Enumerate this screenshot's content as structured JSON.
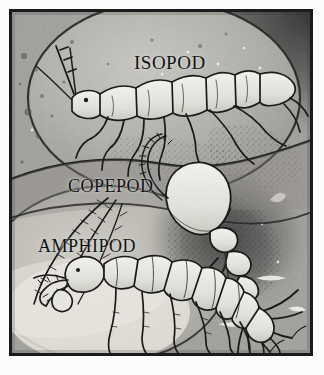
{
  "plate": {
    "title": "Crustacean plate",
    "medium": "halftone grayscale line illustration",
    "frame_color": "#1b1b1b",
    "background_color": "#9b9b9b",
    "ink_color": "#121212",
    "highlight_color": "#f0efe9"
  },
  "labels": [
    {
      "id": "isopod",
      "text": "ISOPOD",
      "x": 122,
      "y": 40
    },
    {
      "id": "copepod",
      "text": "COPEPOD",
      "x": 56,
      "y": 164
    },
    {
      "id": "amphipod",
      "text": "AMPHIPOD",
      "x": 26,
      "y": 224
    }
  ],
  "subjects": [
    {
      "name": "isopod",
      "label": "ISOPOD",
      "description": "segmented flattened crustacean, head at left, seven pairs of legs, two long antennae, uropods at right",
      "position": "upper area inside large circle"
    },
    {
      "name": "copepod",
      "label": "COPEPOD",
      "description": "shrimp-like crustacean with large rounded carapace, segmented abdomen, feathery antennae and forked caudal rami",
      "position": "right-centre, pointing down-right"
    },
    {
      "name": "amphipod",
      "label": "AMPHIPOD",
      "description": "laterally compressed crustacean, curved segmented body, many pereopods, antennae at left",
      "position": "lower left"
    }
  ]
}
